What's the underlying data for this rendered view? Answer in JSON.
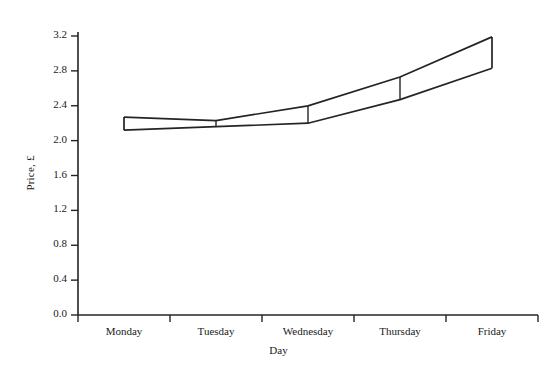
{
  "chart_data": {
    "type": "area",
    "title": "",
    "subtitle": "",
    "xlabel": "Day",
    "ylabel": "Price, £",
    "categories": [
      "Monday",
      "Tuesday",
      "Wednesday",
      "Thursday",
      "Friday"
    ],
    "x_boundaries": [
      "Mon/start",
      "Mon|Tue",
      "Tue|Wed",
      "Wed|Thu",
      "Thu|Fri",
      "Fri/end"
    ],
    "ylim": [
      0.0,
      3.2
    ],
    "xlim_note": "categorical, 5 equal intervals",
    "grid": false,
    "legend": "none",
    "y_tick_labels": [
      "0.0",
      "0.4",
      "0.8",
      "1.2",
      "1.6",
      "2.0",
      "2.4",
      "2.8",
      "3.2"
    ],
    "y_tick_values": [
      0.0,
      0.4,
      0.8,
      1.2,
      1.6,
      2.0,
      2.4,
      2.8,
      3.2
    ],
    "series": [
      {
        "name": "Upper bound",
        "values": [
          2.27,
          2.23,
          2.4,
          2.73,
          3.19
        ],
        "values_at_boundaries": [
          2.27,
          2.23,
          2.4,
          2.73,
          3.19
        ]
      },
      {
        "name": "Lower bound",
        "values": [
          2.12,
          2.16,
          2.2,
          2.47,
          2.83
        ],
        "values_at_boundaries": [
          2.12,
          2.16,
          2.2,
          2.47,
          2.83
        ]
      }
    ],
    "segments": [
      {
        "category": "Monday",
        "upper_start": 2.27,
        "upper_end": 2.23,
        "lower_start": 2.12,
        "lower_end": 2.16
      },
      {
        "category": "Tuesday",
        "upper_start": 2.23,
        "upper_end": 2.4,
        "lower_start": 2.16,
        "lower_end": 2.2
      },
      {
        "category": "Wednesday",
        "upper_start": 2.4,
        "upper_end": 2.73,
        "lower_start": 2.2,
        "lower_end": 2.47
      },
      {
        "category": "Thursday",
        "upper_start": 2.73,
        "upper_end": 3.19,
        "lower_start": 2.47,
        "lower_end": 2.83
      }
    ],
    "colors": {
      "line": "#242424",
      "fill": "#ffffff",
      "background": "#ffffff",
      "text": "#1a1a1a"
    }
  },
  "axes": {
    "y_title": "Price, £",
    "x_title": "Day",
    "y_ticks": [
      {
        "label": "0.0"
      },
      {
        "label": "0.4"
      },
      {
        "label": "0.8"
      },
      {
        "label": "1.2"
      },
      {
        "label": "1.6"
      },
      {
        "label": "2.0"
      },
      {
        "label": "2.4"
      },
      {
        "label": "2.8"
      },
      {
        "label": "3.2"
      }
    ],
    "x_ticks": [
      {
        "label": "Monday"
      },
      {
        "label": "Tuesday"
      },
      {
        "label": "Wednesday"
      },
      {
        "label": "Thursday"
      },
      {
        "label": "Friday"
      }
    ]
  }
}
